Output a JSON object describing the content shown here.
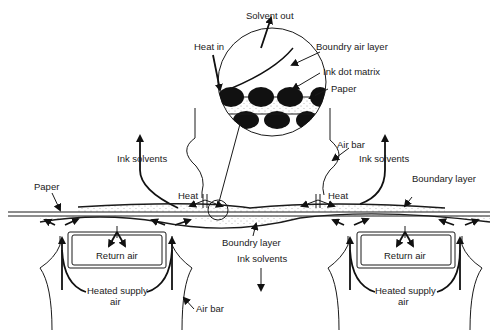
{
  "diagram": {
    "type": "air-bar ink drying schematic",
    "inset": {
      "solvent_out": "Solvent out",
      "heat_in": "Heat in",
      "boundary_air_layer": "Boundry air layer",
      "ink_dot_matrix": "Ink dot matrix",
      "paper": "Paper"
    },
    "labels": {
      "air_bar_top": "Air bar",
      "ink_solvents_left": "Ink solvents",
      "ink_solvents_right": "Ink solvents",
      "paper": "Paper",
      "heat_left": "Heat",
      "heat_right": "Heat",
      "boundary_layer": "Boundary layer",
      "boundry_layer_bottom": "Boundry layer",
      "ink_solvents_bottom": "Ink solvents",
      "return_air_left": "Return air",
      "return_air_right": "Return air",
      "heated_supply_left_1": "Heated supply",
      "heated_supply_left_2": "air",
      "heated_supply_right_1": "Heated supply",
      "heated_supply_right_2": "air",
      "air_bar_bottom": "Air bar"
    },
    "colors": {
      "line": "#1a1a1a",
      "background": "#ffffff"
    }
  }
}
